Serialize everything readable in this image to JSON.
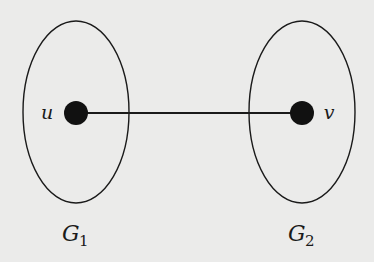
{
  "diagram": {
    "type": "graph",
    "colors": {
      "background": "#ebebea",
      "stroke": "#1a1a1a",
      "node_fill": "#111111"
    },
    "subgraphs": [
      {
        "id": "G1",
        "label_main": "G",
        "label_sub": "1",
        "contains": [
          "u"
        ]
      },
      {
        "id": "G2",
        "label_main": "G",
        "label_sub": "2",
        "contains": [
          "v"
        ]
      }
    ],
    "nodes": [
      {
        "id": "u",
        "label": "u",
        "subgraph": "G1"
      },
      {
        "id": "v",
        "label": "v",
        "subgraph": "G2"
      }
    ],
    "edges": [
      {
        "from": "u",
        "to": "v"
      }
    ]
  }
}
